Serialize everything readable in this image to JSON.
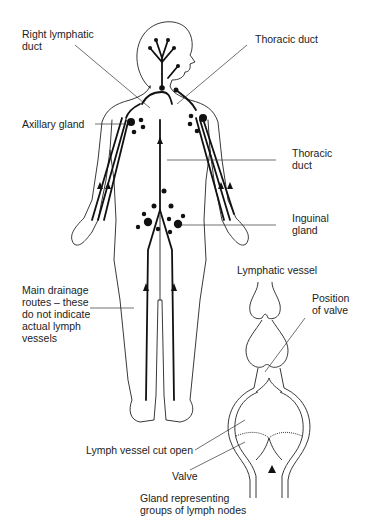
{
  "figure": {
    "labels": {
      "right_lymphatic_duct": "Right lymphatic\nduct",
      "thoracic_duct_top": "Thoracic duct",
      "axillary_gland": "Axillary gland",
      "thoracic_duct_mid": "Thoracic\nduct",
      "inguinal_gland": "Inguinal\ngland",
      "main_drainage": "Main drainage\nroutes – these\ndo not indicate\nactual lymph\nvessels",
      "lymphatic_vessel": "Lymphatic vessel",
      "position_of_valve": "Position\nof valve",
      "lymph_vessel_cut_open": "Lymph vessel cut open",
      "valve": "Valve",
      "gland_representing": "Gland representing\ngroups of lymph nodes"
    }
  }
}
